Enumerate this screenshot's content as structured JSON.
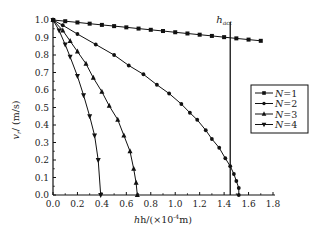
{
  "chart_data": {
    "type": "line",
    "title": "",
    "xlabel": "h/(×10⁻⁴m)",
    "ylabel": "v_r/(m/s)",
    "xlim": [
      0.0,
      1.8
    ],
    "ylim": [
      0.0,
      1.0
    ],
    "x_ticks": [
      "0.0",
      "0.2",
      "0.4",
      "0.6",
      "0.8",
      "1.0",
      "1.2",
      "1.4",
      "1.6",
      "1.8"
    ],
    "y_ticks": [
      "0.0",
      "0.1",
      "0.2",
      "0.3",
      "0.4",
      "0.5",
      "0.6",
      "0.7",
      "0.8",
      "0.9",
      "1.0"
    ],
    "grid": false,
    "legend_position": "right, middle (inside plot)",
    "annotation": {
      "label": "h_act",
      "x": 1.45
    },
    "series": [
      {
        "name": "N=1",
        "marker": "square",
        "points": [
          [
            0,
            1.0
          ],
          [
            0.1,
            0.993
          ],
          [
            0.2,
            0.986
          ],
          [
            0.3,
            0.979
          ],
          [
            0.4,
            0.972
          ],
          [
            0.5,
            0.965
          ],
          [
            0.6,
            0.958
          ],
          [
            0.7,
            0.951
          ],
          [
            0.8,
            0.944
          ],
          [
            0.9,
            0.937
          ],
          [
            1.0,
            0.93
          ],
          [
            1.1,
            0.923
          ],
          [
            1.2,
            0.916
          ],
          [
            1.3,
            0.909
          ],
          [
            1.4,
            0.902
          ],
          [
            1.5,
            0.895
          ],
          [
            1.6,
            0.888
          ],
          [
            1.7,
            0.881
          ]
        ]
      },
      {
        "name": "N=2",
        "marker": "circle",
        "points": [
          [
            0,
            1.0
          ],
          [
            0.08,
            0.97
          ],
          [
            0.2,
            0.92
          ],
          [
            0.35,
            0.86
          ],
          [
            0.5,
            0.8
          ],
          [
            0.62,
            0.74
          ],
          [
            0.74,
            0.69
          ],
          [
            0.85,
            0.63
          ],
          [
            0.95,
            0.58
          ],
          [
            1.05,
            0.52
          ],
          [
            1.12,
            0.47
          ],
          [
            1.18,
            0.43
          ],
          [
            1.25,
            0.37
          ],
          [
            1.3,
            0.32
          ],
          [
            1.36,
            0.27
          ],
          [
            1.41,
            0.21
          ],
          [
            1.45,
            0.165
          ],
          [
            1.48,
            0.12
          ],
          [
            1.5,
            0.08
          ],
          [
            1.52,
            0.04
          ],
          [
            1.52,
            0.0
          ]
        ]
      },
      {
        "name": "N=3",
        "marker": "triangle-up",
        "points": [
          [
            0,
            1.0
          ],
          [
            0.08,
            0.94
          ],
          [
            0.14,
            0.88
          ],
          [
            0.2,
            0.82
          ],
          [
            0.27,
            0.75
          ],
          [
            0.33,
            0.67
          ],
          [
            0.4,
            0.59
          ],
          [
            0.46,
            0.51
          ],
          [
            0.53,
            0.43
          ],
          [
            0.58,
            0.34
          ],
          [
            0.63,
            0.25
          ],
          [
            0.66,
            0.15
          ],
          [
            0.68,
            0.07
          ],
          [
            0.69,
            0.0
          ]
        ]
      },
      {
        "name": "N=4",
        "marker": "triangle-down",
        "points": [
          [
            0,
            1.0
          ],
          [
            0.05,
            0.94
          ],
          [
            0.1,
            0.86
          ],
          [
            0.14,
            0.79
          ],
          [
            0.2,
            0.68
          ],
          [
            0.25,
            0.57
          ],
          [
            0.3,
            0.45
          ],
          [
            0.34,
            0.34
          ],
          [
            0.37,
            0.2
          ],
          [
            0.39,
            0.0
          ]
        ]
      }
    ]
  },
  "legend": {
    "items": [
      "N=1",
      "N=2",
      "N=3",
      "N=4"
    ]
  },
  "labels": {
    "ylabel_main": "v",
    "ylabel_sub": "r",
    "ylabel_unit": "/ (m/s)",
    "xlabel_pre": "h/(×10",
    "xlabel_exp": "-4",
    "xlabel_post": "m)",
    "hact_main": "h",
    "hact_sub": "act"
  }
}
